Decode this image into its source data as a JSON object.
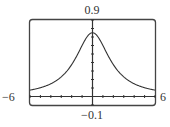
{
  "chart_data": {
    "type": "line",
    "title": "",
    "xlabel": "",
    "ylabel": "",
    "xlim": [
      -6,
      6
    ],
    "ylim": [
      -0.1,
      0.9
    ],
    "window_labels": {
      "xmin": "−6",
      "xmax": "6",
      "ymin": "−0.1",
      "ymax": "0.9"
    },
    "x_tick_step": 1,
    "y_tick_step": 0.1,
    "grid": false,
    "legend": null,
    "series": [
      {
        "name": "y = 3/(x^2+4)",
        "x": [
          -6,
          -5,
          -4,
          -3,
          -2,
          -1,
          0,
          1,
          2,
          3,
          4,
          5,
          6
        ],
        "values": [
          0.075,
          0.103,
          0.15,
          0.231,
          0.375,
          0.6,
          0.75,
          0.6,
          0.375,
          0.231,
          0.15,
          0.103,
          0.075
        ]
      }
    ],
    "colors": {
      "curve": "#333333",
      "frame": "#444444",
      "axis": "#333333"
    }
  }
}
